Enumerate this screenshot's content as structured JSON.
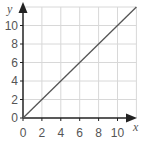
{
  "chart_data": {
    "type": "line",
    "title": "",
    "xlabel": "x",
    "ylabel": "y",
    "xlim": [
      0,
      12
    ],
    "ylim": [
      0,
      12
    ],
    "grid": true,
    "x_ticks": [
      "0",
      "2",
      "4",
      "6",
      "8",
      "10"
    ],
    "y_ticks": [
      "0",
      "2",
      "4",
      "6",
      "8",
      "10"
    ],
    "series": [
      {
        "name": "y = x",
        "x": [
          0,
          12
        ],
        "values": [
          0,
          12
        ],
        "color": "#555555"
      }
    ]
  },
  "colors": {
    "grid": "#d8d8d8",
    "axis": "#222222",
    "line": "#555555",
    "text": "#555555"
  }
}
